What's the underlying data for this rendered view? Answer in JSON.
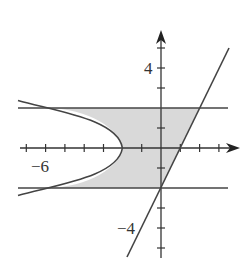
{
  "diagram": {
    "axes": {
      "x_label_min": "−6",
      "y_label_max": "4",
      "y_label_min": "−4",
      "x_range": [
        -7,
        4
      ],
      "y_range": [
        -5,
        5
      ]
    },
    "curves": [
      {
        "name": "parabola",
        "equation": "x = -2 - y^2"
      },
      {
        "name": "line",
        "equation": "y = 2x - 2"
      },
      {
        "name": "upper-horizontal",
        "equation": "y = 2"
      },
      {
        "name": "lower-horizontal",
        "equation": "y = -2"
      }
    ],
    "shaded_region": "between parabola and line for -2 <= y <= 2",
    "colors": {
      "curve": "#444444",
      "shade": "#d9d9d9",
      "axis": "#333333"
    }
  }
}
